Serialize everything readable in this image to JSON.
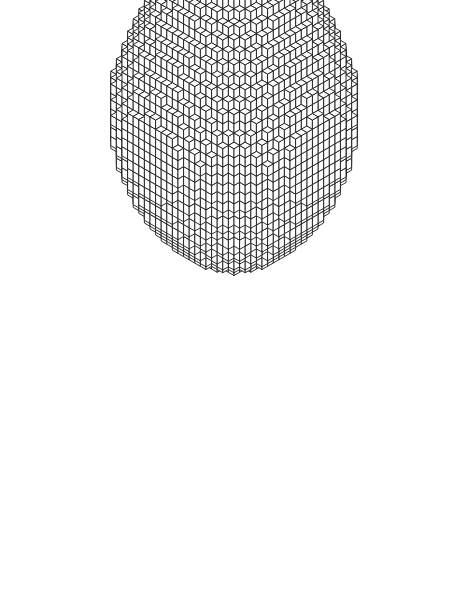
{
  "figure": {
    "render_mode": "isometric-wireframe",
    "object_name": "egg",
    "background_color": "#ffffff",
    "line_color": "#1a1a1a",
    "face_color": "#ffffff",
    "line_width": 0.9
  },
  "canvas": {
    "width": 469,
    "height": 599
  },
  "geometry": {
    "lattice_resolution": 34,
    "cube_screen_width": 11.2,
    "cube_screen_height": 6.46,
    "cube_vertical_rise": 9.2,
    "origin_x": 234,
    "origin_y": 96,
    "bounds": {
      "left": 35,
      "right": 435,
      "top": 25,
      "bottom": 566
    },
    "egg": {
      "shape_equation": "x^2/a^2 + y^2/a^2 + z^2/b^2 <= 1, tapered in +z",
      "radius_equatorial": 15.5,
      "half_height": 17.0,
      "taper_coefficient": 0.36,
      "taper_power": 1.0,
      "pointed_end": "top",
      "blunt_end": "bottom"
    },
    "projection": {
      "type": "isometric",
      "azimuth_deg": 45,
      "elevation_deg": 30
    }
  },
  "chart_data": {
    "type": "scatter",
    "xlabel": "",
    "ylabel": "",
    "categories": [],
    "values": []
  }
}
